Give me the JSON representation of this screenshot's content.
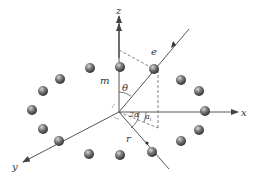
{
  "diagram": {
    "type": "3d-coordinate-schematic",
    "colors": {
      "axis": "#555555",
      "dashed": "#666666",
      "ball_light": "#cfcfcf",
      "ball_dark": "#3a3a3a",
      "background": "#ffffff"
    },
    "axes": {
      "x_label": "x",
      "y_label": "y",
      "z_label": "z"
    },
    "labels": {
      "mass": "m",
      "electron": "e",
      "theta": "θ",
      "two_alpha": "2α",
      "alpha_i": "a",
      "alpha_i_sub": "i",
      "radius": "r"
    },
    "origin": {
      "x": 119,
      "y": 112
    },
    "balls": [
      {
        "x": 120,
        "y": 67,
        "role": "on-z-axis"
      },
      {
        "x": 154,
        "y": 69,
        "role": "electron"
      },
      {
        "x": 181,
        "y": 80
      },
      {
        "x": 199,
        "y": 91
      },
      {
        "x": 205,
        "y": 111,
        "role": "on-x-axis"
      },
      {
        "x": 199,
        "y": 130
      },
      {
        "x": 181,
        "y": 141
      },
      {
        "x": 152,
        "y": 152,
        "role": "on-r-line"
      },
      {
        "x": 120,
        "y": 155
      },
      {
        "x": 89,
        "y": 154
      },
      {
        "x": 59,
        "y": 141,
        "role": "on-y-axis"
      },
      {
        "x": 43,
        "y": 129
      },
      {
        "x": 32,
        "y": 110
      },
      {
        "x": 43,
        "y": 91
      },
      {
        "x": 60,
        "y": 79
      },
      {
        "x": 90,
        "y": 68
      }
    ]
  }
}
